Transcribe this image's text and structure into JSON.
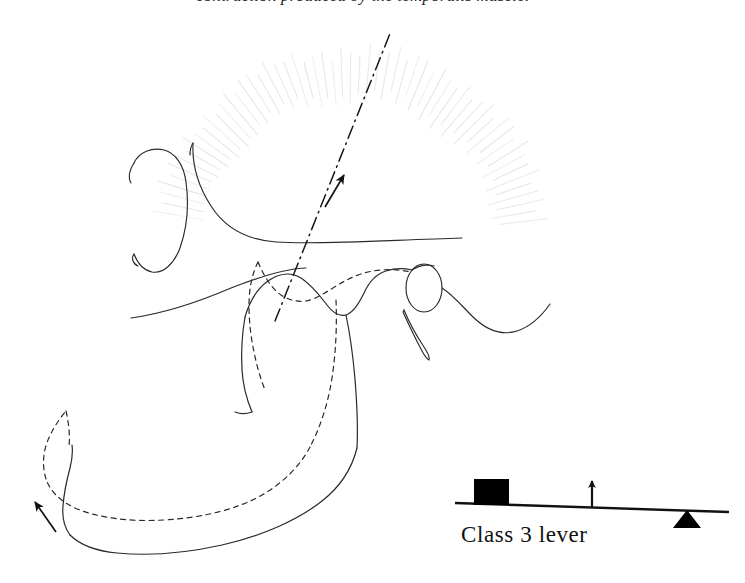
{
  "figure": {
    "title_fragment": "contraction produced by the temporalis muscle.",
    "background_color": "#ffffff",
    "ink_color": "#1f1f1f",
    "hatch_color": "#e6e6ea",
    "muscle": {
      "name": "temporalis-muscle-hatching",
      "fiber_count": 58,
      "arc_center_x": 352,
      "arc_center_y": 246,
      "inner_radius": 150,
      "outer_radius": 196,
      "start_angle_deg": -170,
      "end_angle_deg": -8
    },
    "force_vector": {
      "name": "line-of-pull",
      "style": "dash-dot",
      "x1": 275,
      "y1": 321,
      "x2": 391,
      "y2": 31,
      "arrow_x": 341,
      "arrow_y": 181,
      "arrow_label": "direction of muscle pull"
    },
    "motion_arrow": {
      "name": "chin-elevation-arrow",
      "x1": 56,
      "y1": 532,
      "x2": 35,
      "y2": 502,
      "arrow_label": "direction of chin movement"
    },
    "outlines": [
      {
        "name": "ear-auricle",
        "style": "solid"
      },
      {
        "name": "skull-base-contour",
        "style": "solid"
      },
      {
        "name": "zygomatic-arch",
        "style": "solid"
      },
      {
        "name": "mandible-resting-position",
        "style": "solid"
      },
      {
        "name": "mandible-displaced-position",
        "style": "dashed"
      },
      {
        "name": "condyle",
        "style": "solid"
      },
      {
        "name": "coronoid-process",
        "style": "solid"
      },
      {
        "name": "styloid-process",
        "style": "solid"
      }
    ]
  },
  "lever": {
    "caption": "Class 3  lever",
    "class_number": "3",
    "bar": {
      "name": "lever-bar",
      "x1": 455,
      "y1": 503,
      "x2": 729,
      "y2": 512
    },
    "load": {
      "name": "load-block",
      "shape": "square",
      "color": "#000000",
      "x": 474,
      "y": 479,
      "width": 35,
      "height": 26
    },
    "effort": {
      "name": "effort-arrow",
      "direction": "up",
      "x": 592,
      "y_top": 477,
      "y_bottom": 508
    },
    "fulcrum": {
      "name": "fulcrum-triangle",
      "shape": "triangle",
      "color": "#000000",
      "cx": 687,
      "y_top": 510,
      "y_bottom": 528,
      "half_width": 14
    }
  }
}
